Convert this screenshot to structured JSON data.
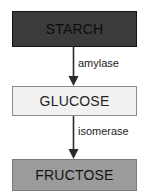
{
  "diagram": {
    "canvas": {
      "width": 161,
      "height": 193,
      "background": "#ffffff"
    },
    "nodes": [
      {
        "id": "starch",
        "label": "STARCH",
        "fill": "#3b3b3b",
        "border": "#121212",
        "text_color": "#0c0c0c"
      },
      {
        "id": "glucose",
        "label": "GLUCOSE",
        "fill": "#f1f1f1",
        "border": "#8d8d8d",
        "text_color": "#232323"
      },
      {
        "id": "fructose",
        "label": "FRUCTOSE",
        "fill": "#9b9b9b",
        "border": "#7a7a7a",
        "text_color": "#141414"
      }
    ],
    "edges": [
      {
        "id": "starch-to-glucose",
        "label": "amylase",
        "from": "starch",
        "to": "glucose",
        "color": "#2b2b2b",
        "arrowhead": "filled-triangle-down"
      },
      {
        "id": "glucose-to-fructose",
        "label": "isomerase",
        "from": "glucose",
        "to": "fructose",
        "color": "#2b2b2b",
        "arrowhead": "filled-triangle-down"
      }
    ]
  }
}
